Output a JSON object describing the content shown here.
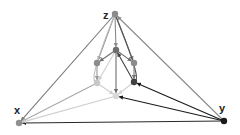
{
  "diagram": {
    "type": "directed-graph",
    "nodes": [
      {
        "id": "z",
        "label": "z",
        "color": "#8a8a8a"
      },
      {
        "id": "x",
        "label": "x",
        "color": "#8f8f8f"
      },
      {
        "id": "y",
        "label": "y",
        "color": "#1a1a1a"
      },
      {
        "id": "c",
        "label": "",
        "color": "#6e6e6e"
      },
      {
        "id": "l1",
        "label": "",
        "color": "#8c8c8c"
      },
      {
        "id": "r1",
        "label": "",
        "color": "#8c8c8c"
      },
      {
        "id": "l2",
        "label": "",
        "color": "#c8c8c8"
      },
      {
        "id": "r2",
        "label": "",
        "color": "#404040"
      },
      {
        "id": "b",
        "label": "",
        "color": "#d8d8d8"
      }
    ],
    "edges": [
      {
        "from": "z",
        "to": "x",
        "color": "#7a7a7a"
      },
      {
        "from": "y",
        "to": "z",
        "color": "#8a8a8a"
      },
      {
        "from": "y",
        "to": "x",
        "color": "#2a2a2a"
      },
      {
        "from": "z",
        "to": "c",
        "color": "#8a8a8a"
      },
      {
        "from": "z",
        "to": "l1",
        "color": "#8a8a8a"
      },
      {
        "from": "z",
        "to": "r1",
        "color": "#7a7a7a"
      },
      {
        "from": "z",
        "to": "l2",
        "color": "#bdbdbd",
        "curved": true
      },
      {
        "from": "z",
        "to": "r2",
        "color": "#555555",
        "curved": true
      },
      {
        "from": "c",
        "to": "l1",
        "color": "#6e6e6e"
      },
      {
        "from": "c",
        "to": "r1",
        "color": "#6e6e6e"
      },
      {
        "from": "c",
        "to": "b",
        "color": "#6e6e6e"
      },
      {
        "from": "r2",
        "to": "c",
        "color": "#444444"
      },
      {
        "from": "l1",
        "to": "l2",
        "color": "#9a9a9a"
      },
      {
        "from": "r1",
        "to": "r2",
        "color": "#777777"
      },
      {
        "from": "c",
        "to": "l2",
        "color": "#cfcfcf"
      },
      {
        "from": "l2",
        "to": "b",
        "color": "#cfcfcf"
      },
      {
        "from": "r2",
        "to": "b",
        "color": "#cfcfcf"
      },
      {
        "from": "y",
        "to": "r2",
        "color": "#1a1a1a"
      },
      {
        "from": "y",
        "to": "b",
        "color": "#1a1a1a"
      },
      {
        "from": "l2",
        "to": "x",
        "color": "#a8a8a8"
      },
      {
        "from": "b",
        "to": "x",
        "color": "#cfcfcf"
      }
    ]
  }
}
